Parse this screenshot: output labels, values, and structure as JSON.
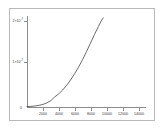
{
  "chart_data": {
    "type": "line",
    "title": "",
    "subtitle": "",
    "xlabel": "",
    "ylabel": "",
    "xlim": [
      0,
      15000
    ],
    "ylim": [
      0,
      2.35e-07
    ],
    "grid": false,
    "legend": null,
    "series": [
      {
        "name": "exponential-growth",
        "color": "#3a3a3a",
        "x": [
          0,
          500,
          1000,
          1500,
          2000,
          2500,
          3000,
          3500,
          4000,
          4500,
          5000,
          5500,
          6000,
          6500,
          7000,
          7500,
          8000,
          8500,
          9000,
          9300,
          9600
        ],
        "y": [
          1e-09,
          1.6e-09,
          2.6e-09,
          4.2e-09,
          6.6e-09,
          1.05e-08,
          1.65e-08,
          2.6e-08,
          3.4e-08,
          4.4e-08,
          5.6e-08,
          7e-08,
          8.6e-08,
          1.03e-07,
          1.22e-07,
          1.43e-07,
          1.65e-07,
          1.87e-07,
          2.08e-07,
          2.2e-07,
          2.3e-07
        ]
      }
    ],
    "y_ticks": [
      {
        "value": 1e-07,
        "mantissa": "1",
        "base": "10",
        "exponent": "-7",
        "label": "1×10",
        "pixel_y": 62
      },
      {
        "value": 2e-07,
        "mantissa": "2",
        "base": "10",
        "exponent": "-7",
        "label": "2×10",
        "pixel_y": 21
      }
    ],
    "x_ticks": [
      {
        "value": 2000,
        "label": "2000"
      },
      {
        "value": 4000,
        "label": "4000"
      },
      {
        "value": 6000,
        "label": "6000"
      },
      {
        "value": 8000,
        "label": "8000"
      },
      {
        "value": 10000,
        "label": "10000"
      },
      {
        "value": 12000,
        "label": "12000"
      },
      {
        "value": 14000,
        "label": "14000"
      }
    ],
    "origin_label": "0",
    "colors": {
      "curve": "#3a3a3a",
      "axis": "#8c8c8c",
      "frame": "#b9b9b9",
      "background": "#ffffff",
      "tick_text": "#3a3a3a"
    }
  }
}
